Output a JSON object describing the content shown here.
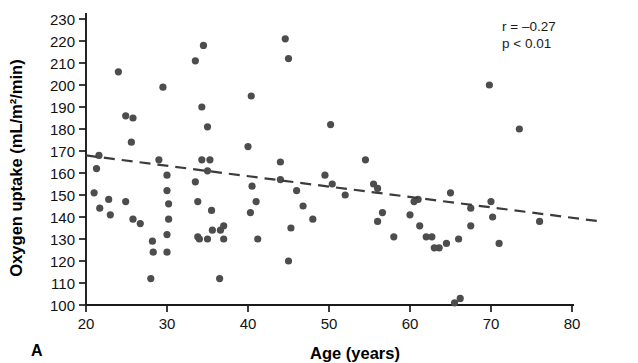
{
  "figure": {
    "panel_label": "A",
    "background_color": "#ffffff",
    "point_color": "#4d4d4d",
    "axis_color": "#1a1a1a",
    "trend_color": "#3b3b3b"
  },
  "annotations": {
    "correlation": "r = –0.27",
    "p_value": "p < 0.01"
  },
  "chart_data": {
    "type": "scatter",
    "title": "",
    "xlabel": "Age (years)",
    "ylabel": "Oxygen uptake (mL/m²/min)",
    "xlim": [
      20,
      80
    ],
    "ylim": [
      100,
      230
    ],
    "xticks": [
      20,
      30,
      40,
      50,
      60,
      70,
      80
    ],
    "yticks": [
      100,
      110,
      120,
      130,
      140,
      150,
      160,
      170,
      180,
      190,
      200,
      210,
      220,
      230
    ],
    "grid": false,
    "legend": null,
    "series": [
      {
        "name": "Subjects",
        "marker": "filled-circle",
        "points": [
          [
            21.6,
            168
          ],
          [
            21.0,
            151
          ],
          [
            21.7,
            144
          ],
          [
            21.3,
            162
          ],
          [
            24.0,
            206
          ],
          [
            24.9,
            186
          ],
          [
            25.8,
            185
          ],
          [
            25.6,
            174
          ],
          [
            22.8,
            148
          ],
          [
            24.9,
            147
          ],
          [
            25.8,
            139
          ],
          [
            26.7,
            137
          ],
          [
            23.0,
            141
          ],
          [
            28.2,
            129
          ],
          [
            28.3,
            124
          ],
          [
            28.0,
            112
          ],
          [
            29.5,
            199
          ],
          [
            29.0,
            166
          ],
          [
            30.0,
            159
          ],
          [
            30.0,
            152
          ],
          [
            30.2,
            146
          ],
          [
            30.2,
            139
          ],
          [
            30.0,
            132
          ],
          [
            30.0,
            124
          ],
          [
            33.5,
            211
          ],
          [
            35.0,
            181
          ],
          [
            34.3,
            190
          ],
          [
            34.3,
            166
          ],
          [
            34.5,
            218
          ],
          [
            35.3,
            166
          ],
          [
            35.0,
            161
          ],
          [
            33.5,
            156
          ],
          [
            33.8,
            147
          ],
          [
            35.5,
            143
          ],
          [
            36.6,
            134
          ],
          [
            35.6,
            134
          ],
          [
            33.8,
            131
          ],
          [
            35.0,
            130
          ],
          [
            34.0,
            130
          ],
          [
            37.0,
            136
          ],
          [
            37.0,
            130
          ],
          [
            36.5,
            112
          ],
          [
            40.4,
            195
          ],
          [
            40.0,
            172
          ],
          [
            40.5,
            154
          ],
          [
            40.3,
            142
          ],
          [
            41.0,
            147
          ],
          [
            41.2,
            130
          ],
          [
            44.6,
            221
          ],
          [
            45.0,
            212
          ],
          [
            44.0,
            165
          ],
          [
            44.0,
            157
          ],
          [
            45.3,
            135
          ],
          [
            45.0,
            120
          ],
          [
            46.0,
            152
          ],
          [
            46.8,
            145
          ],
          [
            48.0,
            139
          ],
          [
            49.5,
            159
          ],
          [
            50.2,
            182
          ],
          [
            50.4,
            155
          ],
          [
            52.0,
            150
          ],
          [
            54.5,
            166
          ],
          [
            55.5,
            155
          ],
          [
            56.0,
            153
          ],
          [
            56.6,
            142
          ],
          [
            56.0,
            138
          ],
          [
            58.0,
            131
          ],
          [
            60.5,
            147
          ],
          [
            60.0,
            141
          ],
          [
            61.0,
            148
          ],
          [
            61.2,
            136
          ],
          [
            62.0,
            131
          ],
          [
            62.7,
            131
          ],
          [
            63.6,
            126
          ],
          [
            63.0,
            126
          ],
          [
            64.5,
            128
          ],
          [
            65.0,
            151
          ],
          [
            66.0,
            130
          ],
          [
            66.2,
            103
          ],
          [
            65.5,
            101
          ],
          [
            67.5,
            144
          ],
          [
            67.5,
            136
          ],
          [
            69.8,
            200
          ],
          [
            70.0,
            147
          ],
          [
            70.2,
            140
          ],
          [
            71.0,
            128
          ],
          [
            73.5,
            180
          ],
          [
            76.0,
            138
          ]
        ]
      }
    ],
    "trendline": {
      "style": "dashed",
      "x_start": 20,
      "y_start": 168,
      "x_end": 83.5,
      "y_end": 138
    }
  }
}
